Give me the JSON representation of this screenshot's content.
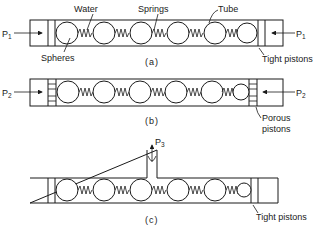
{
  "figure": {
    "panels": [
      {
        "id": "a",
        "caption": "(a)",
        "pressure_left": {
          "symbol": "P",
          "subscript": "1"
        },
        "pressure_right": {
          "symbol": "P",
          "subscript": "1"
        },
        "labels": {
          "water": "Water",
          "springs": "Springs",
          "tube": "Tube",
          "spheres": "Spheres",
          "pistons": "Tight pistons"
        },
        "sphere_count": 6
      },
      {
        "id": "b",
        "caption": "(b)",
        "pressure_left": {
          "symbol": "P",
          "subscript": "2"
        },
        "pressure_right": {
          "symbol": "P",
          "subscript": "2"
        },
        "labels": {
          "pistons_line1": "Porous",
          "pistons_line2": "pistons"
        },
        "sphere_count": 6
      },
      {
        "id": "c",
        "caption": "(c)",
        "pressure_top": {
          "symbol": "P",
          "subscript": "3"
        },
        "labels": {
          "pistons": "Tight pistons"
        },
        "sphere_count": 6
      }
    ]
  }
}
